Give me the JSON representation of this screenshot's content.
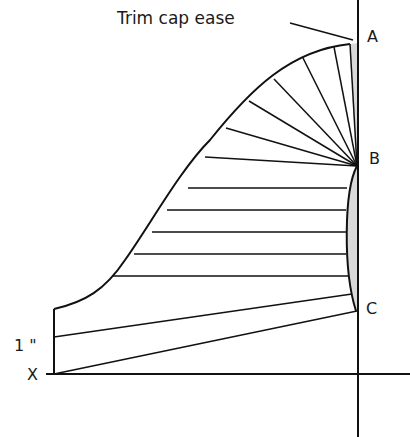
{
  "diagram": {
    "title_callout": "Trim cap ease",
    "point_labels": {
      "a": "A",
      "b": "B",
      "c": "C",
      "x": "X"
    },
    "measure_label": "1 \"",
    "colors": {
      "line": "#111111",
      "ease_fill": "#d9d9d9",
      "background": "#ffffff"
    }
  }
}
